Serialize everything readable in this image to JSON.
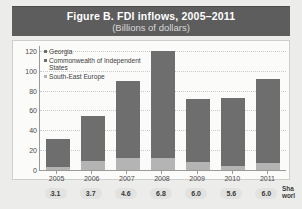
{
  "banner": {
    "title": "Figure B. FDI inflows, 2005–2011",
    "subtitle": "(Billions of dollars)"
  },
  "chart_data": {
    "type": "bar",
    "title": "Figure B. FDI inflows, 2005–2011",
    "subtitle": "(Billions of dollars)",
    "xlabel": "",
    "ylabel": "",
    "ylim": [
      0,
      125
    ],
    "yticks": [
      0,
      20,
      40,
      60,
      80,
      100,
      120
    ],
    "ytick_labels": [
      "0",
      "20",
      "40",
      "60",
      "80",
      "100",
      "120"
    ],
    "grid": true,
    "legend_position": "top-left",
    "categories": [
      "2005",
      "2006",
      "2007",
      "2008",
      "2009",
      "2010",
      "2011"
    ],
    "series": [
      {
        "name": "Georgia",
        "color": "#6e6e6e",
        "values": [
          1.1,
          1.2,
          2.0,
          1.6,
          0.7,
          0.9,
          1.1
        ]
      },
      {
        "name": "Commonwealth of Independent States",
        "color": "#6e6e6e",
        "values": [
          31,
          54,
          90,
          120,
          72,
          73,
          92
        ]
      },
      {
        "name": "South-East Europe",
        "color": "#b4b4b4",
        "values": [
          3,
          9,
          12,
          12,
          8,
          4,
          7
        ]
      }
    ],
    "stacked_totals": [
      31,
      54,
      90,
      120,
      72,
      73,
      92
    ],
    "share_of_world": {
      "caption_line1": "Sha",
      "caption_line2": "worl",
      "values": [
        "3.1",
        "3.7",
        "4.6",
        "6.8",
        "6.0",
        "5.6",
        "6.0"
      ]
    }
  }
}
